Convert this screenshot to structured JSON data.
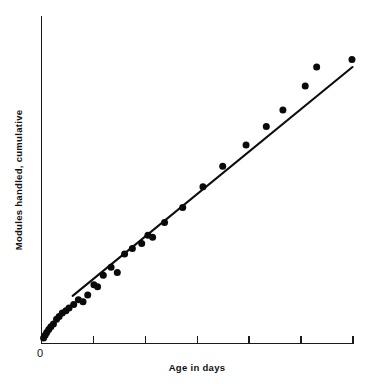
{
  "chart_data": {
    "type": "scatter",
    "title": "",
    "subtitle": "",
    "xlabel": "Age in days",
    "ylabel": "Modules handled, cumulative",
    "origin_label": "0",
    "grid": false,
    "legend": null,
    "axis_style": "left-and-bottom spines, outward ticks on x-axis only, no numeric tick labels",
    "xlim": [
      0,
      6
    ],
    "ylim": [
      0,
      1
    ],
    "x_tick_values": [
      1,
      2,
      3,
      4,
      5,
      6
    ],
    "x_tick_labels": [
      "",
      "",
      "",
      "",
      "",
      ""
    ],
    "y_tick_values": [],
    "y_tick_labels": [],
    "series": [
      {
        "name": "Observed cumulative modules handled",
        "marker": "filled-circle",
        "color": "#0a0a0a",
        "points": [
          {
            "x": 0.04,
            "y": 0.018
          },
          {
            "x": 0.07,
            "y": 0.027
          },
          {
            "x": 0.1,
            "y": 0.036
          },
          {
            "x": 0.14,
            "y": 0.046
          },
          {
            "x": 0.18,
            "y": 0.055
          },
          {
            "x": 0.23,
            "y": 0.064
          },
          {
            "x": 0.29,
            "y": 0.079
          },
          {
            "x": 0.34,
            "y": 0.088
          },
          {
            "x": 0.4,
            "y": 0.1
          },
          {
            "x": 0.47,
            "y": 0.107
          },
          {
            "x": 0.53,
            "y": 0.116
          },
          {
            "x": 0.62,
            "y": 0.128
          },
          {
            "x": 0.71,
            "y": 0.143
          },
          {
            "x": 0.8,
            "y": 0.137
          },
          {
            "x": 0.89,
            "y": 0.159
          },
          {
            "x": 1.01,
            "y": 0.192
          },
          {
            "x": 1.08,
            "y": 0.186
          },
          {
            "x": 1.19,
            "y": 0.223
          },
          {
            "x": 1.34,
            "y": 0.25
          },
          {
            "x": 1.46,
            "y": 0.232
          },
          {
            "x": 1.6,
            "y": 0.293
          },
          {
            "x": 1.75,
            "y": 0.311
          },
          {
            "x": 1.93,
            "y": 0.327
          },
          {
            "x": 2.05,
            "y": 0.354
          },
          {
            "x": 2.14,
            "y": 0.348
          },
          {
            "x": 2.37,
            "y": 0.396
          },
          {
            "x": 2.72,
            "y": 0.445
          },
          {
            "x": 3.11,
            "y": 0.513
          },
          {
            "x": 3.49,
            "y": 0.58
          },
          {
            "x": 3.94,
            "y": 0.65
          },
          {
            "x": 4.33,
            "y": 0.71
          },
          {
            "x": 4.65,
            "y": 0.764
          },
          {
            "x": 5.08,
            "y": 0.843
          },
          {
            "x": 5.3,
            "y": 0.905
          },
          {
            "x": 5.98,
            "y": 0.93
          }
        ]
      }
    ],
    "fit_line": {
      "name": "Fitted straight line",
      "color": "#0d0d0d",
      "start": {
        "x": 0.6,
        "y": 0.156
      },
      "end": {
        "x": 5.99,
        "y": 0.905
      },
      "description": "straight trend line drawn through the scatter, indicating a constant module handling rate"
    },
    "annotations": [
      {
        "text": "outlier above fitted line",
        "x": 4.35,
        "y": 0.71
      }
    ]
  }
}
